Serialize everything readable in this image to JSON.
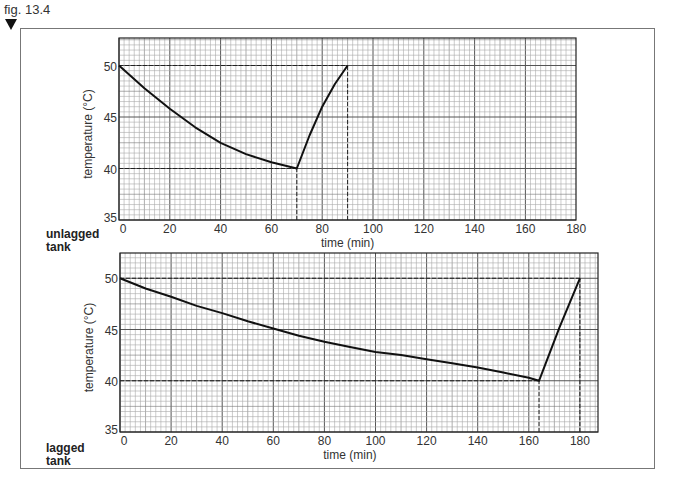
{
  "figure": {
    "label": "fig. 13.4",
    "marker": "down-triangle"
  },
  "panels": [
    {
      "id": "unlagged",
      "tank_label_line1": "unlagged",
      "tank_label_line2": "tank"
    },
    {
      "id": "lagged",
      "tank_label_line1": "lagged",
      "tank_label_line2": "tank"
    }
  ],
  "chart_data": [
    {
      "type": "line",
      "title": "unlagged tank",
      "xlabel": "time (min)",
      "ylabel": "temperature (°C)",
      "xlim": [
        0,
        180
      ],
      "ylim": [
        35,
        52.6
      ],
      "xticks": [
        0,
        20,
        40,
        60,
        80,
        100,
        120,
        140,
        160,
        180
      ],
      "yticks": [
        35,
        40,
        45,
        50
      ],
      "grid": {
        "minor_x_step": 2,
        "minor_y_step": 0.5,
        "major_x_step": 20,
        "major_y_step": 5
      },
      "series": [
        {
          "name": "cooling then reheating",
          "x": [
            0,
            10,
            20,
            30,
            40,
            50,
            60,
            70,
            75,
            80,
            85,
            90
          ],
          "y": [
            50,
            47.8,
            45.8,
            44.0,
            42.5,
            41.4,
            40.6,
            40.0,
            43.2,
            46.0,
            48.2,
            50.0
          ]
        }
      ],
      "reference_lines": {
        "horizontal": [
          {
            "y": 50,
            "x_to": 90
          },
          {
            "y": 40,
            "x_to": 70
          }
        ],
        "vertical": [
          {
            "x": 70,
            "y_from": 35,
            "y_to": 40
          },
          {
            "x": 90,
            "y_from": 35,
            "y_to": 50
          }
        ]
      },
      "color": "#111111"
    },
    {
      "type": "line",
      "title": "lagged tank",
      "xlabel": "time (min)",
      "ylabel": "temperature (°C)",
      "xlim": [
        0,
        187
      ],
      "ylim": [
        35,
        52.6
      ],
      "xticks": [
        0,
        20,
        40,
        60,
        80,
        100,
        120,
        140,
        160,
        180
      ],
      "yticks": [
        35,
        40,
        45,
        50
      ],
      "grid": {
        "minor_x_step": 2,
        "minor_y_step": 0.5,
        "major_x_step": 20,
        "major_y_step": 5
      },
      "series": [
        {
          "name": "cooling then reheating",
          "x": [
            0,
            10,
            20,
            30,
            40,
            50,
            60,
            70,
            80,
            90,
            100,
            110,
            120,
            130,
            140,
            150,
            160,
            164,
            172,
            180
          ],
          "y": [
            50,
            49.0,
            48.2,
            47.3,
            46.6,
            45.8,
            45.1,
            44.4,
            43.8,
            43.3,
            42.8,
            42.5,
            42.1,
            41.7,
            41.3,
            40.8,
            40.3,
            40.0,
            45.2,
            50.0
          ]
        }
      ],
      "reference_lines": {
        "horizontal": [
          {
            "y": 50,
            "x_to": 180
          },
          {
            "y": 40,
            "x_to": 164
          }
        ],
        "vertical": [
          {
            "x": 164,
            "y_from": 35,
            "y_to": 40
          },
          {
            "x": 180,
            "y_from": 35,
            "y_to": 50
          }
        ]
      },
      "color": "#111111"
    }
  ],
  "layout": {
    "panels_px": [
      {
        "left": 119,
        "top": 38,
        "right": 576,
        "bottom": 220,
        "x0": 119,
        "px_per_x": 2.54,
        "y35": 220,
        "px_per_y": 10.3
      },
      {
        "left": 120,
        "top": 253,
        "right": 598,
        "bottom": 432,
        "x0": 120,
        "px_per_x": 2.555,
        "y35": 432,
        "px_per_y": 10.25
      }
    ]
  }
}
